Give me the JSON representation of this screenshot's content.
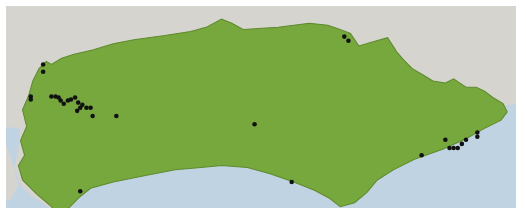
{
  "map": {
    "colors": {
      "background_land": "#d6d4cf",
      "sea": "#c0d3e2",
      "region": "#77a83d",
      "region_border": "#5e8a2e",
      "marker": "#111111",
      "frame": "#ffffff"
    },
    "region_label": "",
    "markers": [
      {
        "x": 42,
        "y": 58
      },
      {
        "x": 42,
        "y": 65
      },
      {
        "x": 30,
        "y": 89
      },
      {
        "x": 30,
        "y": 92
      },
      {
        "x": 50,
        "y": 89
      },
      {
        "x": 54,
        "y": 89
      },
      {
        "x": 57,
        "y": 90
      },
      {
        "x": 59,
        "y": 93
      },
      {
        "x": 62,
        "y": 96
      },
      {
        "x": 66,
        "y": 93
      },
      {
        "x": 69,
        "y": 92
      },
      {
        "x": 73,
        "y": 90
      },
      {
        "x": 76,
        "y": 95
      },
      {
        "x": 80,
        "y": 97
      },
      {
        "x": 78,
        "y": 100
      },
      {
        "x": 75,
        "y": 103
      },
      {
        "x": 84,
        "y": 100
      },
      {
        "x": 88,
        "y": 100
      },
      {
        "x": 90,
        "y": 108
      },
      {
        "x": 113,
        "y": 108
      },
      {
        "x": 334,
        "y": 31
      },
      {
        "x": 338,
        "y": 35
      },
      {
        "x": 247,
        "y": 116
      },
      {
        "x": 283,
        "y": 172
      },
      {
        "x": 78,
        "y": 181
      },
      {
        "x": 409,
        "y": 146
      },
      {
        "x": 432,
        "y": 131
      },
      {
        "x": 436,
        "y": 139
      },
      {
        "x": 440,
        "y": 139
      },
      {
        "x": 444,
        "y": 139
      },
      {
        "x": 448,
        "y": 135
      },
      {
        "x": 452,
        "y": 131
      },
      {
        "x": 463,
        "y": 124
      },
      {
        "x": 463,
        "y": 128
      }
    ]
  }
}
